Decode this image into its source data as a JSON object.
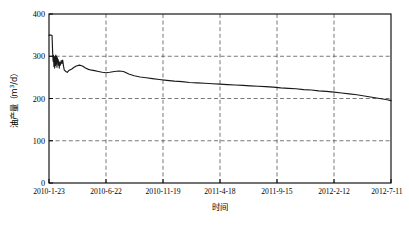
{
  "chart_data": {
    "type": "line",
    "title": "",
    "xlabel": "时间",
    "ylabel_main": "油产量（m",
    "ylabel_sup": "3",
    "ylabel_tail": "/d）",
    "ylabel_full": "油产量（m3/d）",
    "ylim": [
      0,
      400
    ],
    "yticks": [
      0,
      100,
      200,
      300,
      400
    ],
    "ytick_labels": [
      "0",
      "100",
      "200",
      "300",
      "400"
    ],
    "xtick_labels": [
      "2010-1-23",
      "2010-6-22",
      "2010-11-19",
      "2011-4-18",
      "2011-9-15",
      "2012-2-12",
      "2012-7-11"
    ],
    "grid": true,
    "grid_style": "dashed",
    "legend": "none",
    "line_color": "#1a1a1a",
    "grid_color": "#555555",
    "axis_color": "#000000",
    "x_index_range": [
      0,
      900
    ],
    "series": [
      {
        "name": "油产量",
        "x": [
          0,
          3,
          6,
          8,
          10,
          11,
          12,
          13,
          14,
          15,
          16,
          17,
          18,
          19,
          20,
          21,
          22,
          23,
          24,
          25,
          26,
          27,
          28,
          29,
          30,
          32,
          34,
          36,
          38,
          40,
          44,
          48,
          52,
          56,
          60,
          66,
          72,
          80,
          88,
          96,
          104,
          112,
          120,
          130,
          140,
          150,
          160,
          172,
          184,
          196,
          210,
          224,
          240,
          256,
          272,
          290,
          310,
          330,
          350,
          370,
          390,
          410,
          430,
          450,
          470,
          490,
          510,
          530,
          550,
          570,
          590,
          610,
          630,
          650,
          670,
          690,
          710,
          730,
          750,
          770,
          790,
          810,
          830,
          850,
          870,
          890,
          900
        ],
        "values": [
          350,
          350,
          350,
          349,
          300,
          288,
          302,
          276,
          298,
          272,
          300,
          278,
          303,
          281,
          299,
          274,
          296,
          286,
          292,
          279,
          288,
          272,
          285,
          283,
          279,
          290,
          283,
          291,
          278,
          268,
          264,
          262,
          266,
          268,
          270,
          274,
          277,
          279,
          277,
          272,
          269,
          267,
          266,
          264,
          262,
          261,
          262,
          264,
          265,
          264,
          258,
          254,
          251,
          249,
          247,
          245,
          243,
          241,
          240,
          238,
          237,
          236,
          235,
          234,
          233,
          232,
          231,
          230,
          229,
          228,
          227,
          225,
          224,
          223,
          221,
          220,
          218,
          217,
          215,
          213,
          211,
          209,
          206,
          203,
          200,
          197,
          195
        ]
      }
    ]
  },
  "plot_geometry": {
    "left": 49,
    "right": 391,
    "top": 14,
    "bottom": 183
  }
}
